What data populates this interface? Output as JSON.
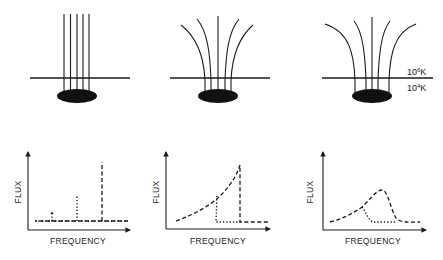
{
  "figure": {
    "panels_top": [
      {
        "id": "uniform-field",
        "description": "Vertical parallel field lines over sunspot"
      },
      {
        "id": "moderate-expansion",
        "description": "Field lines fan out moderately above transition region"
      },
      {
        "id": "strong-expansion",
        "description": "Field lines fan out strongly above transition region"
      }
    ],
    "temperature_labels": {
      "upper": {
        "base": "10",
        "exp": "6",
        "unit": "K"
      },
      "lower": {
        "base": "10",
        "exp": "4",
        "unit": "K"
      }
    },
    "panels_bottom": [
      {
        "xlabel": "FREQUENCY",
        "ylabel": "FLUX"
      },
      {
        "xlabel": "FREQUENCY",
        "ylabel": "FLUX"
      },
      {
        "xlabel": "FREQUENCY",
        "ylabel": "FLUX"
      }
    ]
  },
  "colors": {
    "ink": "#1a1a1a",
    "background": "#ffffff"
  }
}
